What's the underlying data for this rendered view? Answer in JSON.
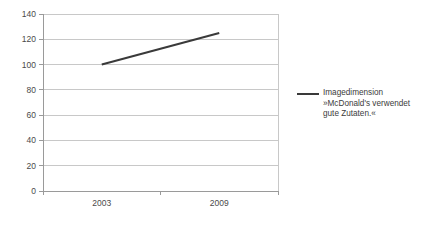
{
  "chart_data": {
    "type": "line",
    "title": "",
    "subtitle": "",
    "xlabel": "",
    "ylabel": "",
    "categories": [
      "2003",
      "2009"
    ],
    "series": [
      {
        "name": "Imagedimension »McDonald's verwendet gute Zutaten.«",
        "values": [
          100,
          125
        ],
        "color": "#3a3a3a"
      }
    ],
    "ylim": [
      0,
      140
    ],
    "yticks": [
      0,
      20,
      40,
      60,
      80,
      100,
      120,
      140
    ],
    "ytick_labels": [
      "0",
      "20",
      "40",
      "60",
      "80",
      "100",
      "120",
      "140"
    ],
    "grid": true,
    "grid_axis": "y",
    "grid_color": "#c8c8c8",
    "axis_color": "#9a9a9a",
    "plot_border": true,
    "legend_position": "right",
    "legend": [
      {
        "label_line1": "Imagedimension",
        "label_line2": "»McDonald's verwendet",
        "label_line3": "gute Zutaten.«",
        "color": "#3a3a3a"
      }
    ],
    "background": "#ffffff"
  }
}
